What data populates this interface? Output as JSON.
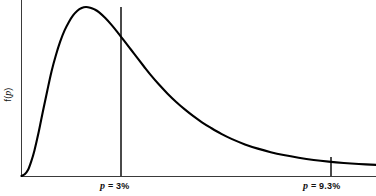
{
  "figure": {
    "background_color": "#ffffff",
    "curve_color": "#000000",
    "axis_color": "#3a3a3a",
    "marker_color": "#4a4a4a",
    "y_axis_label": "f(p)",
    "y_axis_label_variable": "p",
    "y_axis_label_prefix": "f(",
    "y_axis_label_suffix": ")"
  },
  "markers": [
    {
      "id": "mode-marker",
      "variable": "p",
      "equals": " = ",
      "value": "3%",
      "label": "p = 3%",
      "x_px": 121,
      "top_px": 7,
      "bottom_px": 176
    },
    {
      "id": "upper-marker",
      "variable": "p",
      "equals": " = ",
      "value": "9.3%",
      "label": "p = 9.3%",
      "x_px": 331,
      "top_px": 157,
      "bottom_px": 176
    }
  ],
  "chart_data": {
    "type": "line",
    "title": "",
    "subtitle": "",
    "xlabel": "",
    "ylabel": "f(p)",
    "grid": false,
    "legend": null,
    "legend_position": "none",
    "axis_style": "open-L (left spine + bottom spine only, no tick marks, no numeric tick labels)",
    "distribution_shape": "unimodal right-skewed probability density (lognormal-like)",
    "xlim": [
      0,
      16.5
    ],
    "ylim": [
      0,
      1.0
    ],
    "x_unit": "percent",
    "tick_labels": [
      "p = 3%",
      "p = 9.3%"
    ],
    "annotations": [
      {
        "text": "p = 3%",
        "x": 3,
        "y": 1.0,
        "type": "vertical-drop-line-at-mode",
        "note": "vertical line from the curve peak down to the horizontal axis"
      },
      {
        "text": "p = 9.3%",
        "x": 9.3,
        "y": 0.113,
        "type": "vertical-drop-line-on-tail",
        "note": "short vertical line from the curve down to the horizontal axis on the right tail"
      }
    ],
    "series": [
      {
        "name": "f(p)",
        "color": "#000000",
        "x": [
          0.0,
          0.15,
          0.3,
          0.45,
          0.6,
          0.8,
          1.0,
          1.2,
          1.4,
          1.6,
          1.8,
          2.0,
          2.2,
          2.4,
          2.6,
          2.8,
          3.0,
          3.2,
          3.4,
          3.6,
          3.9,
          4.2,
          4.5,
          4.8,
          5.1,
          5.4,
          5.7,
          6.0,
          6.4,
          6.8,
          7.2,
          7.6,
          8.0,
          8.4,
          8.8,
          9.3,
          9.8,
          10.4,
          11.0,
          11.6,
          12.2,
          12.9,
          13.6,
          14.3,
          15.0,
          15.7,
          16.5
        ],
        "y": [
          0.0,
          0.01,
          0.035,
          0.085,
          0.15,
          0.26,
          0.385,
          0.505,
          0.62,
          0.715,
          0.795,
          0.86,
          0.91,
          0.95,
          0.978,
          0.994,
          1.0,
          0.996,
          0.986,
          0.97,
          0.935,
          0.893,
          0.846,
          0.797,
          0.747,
          0.697,
          0.648,
          0.6,
          0.541,
          0.487,
          0.438,
          0.394,
          0.354,
          0.318,
          0.286,
          0.249,
          0.218,
          0.187,
          0.162,
          0.141,
          0.124,
          0.108,
          0.095,
          0.085,
          0.077,
          0.071,
          0.066
        ]
      }
    ],
    "key_points": [
      {
        "name": "origin",
        "x": 0,
        "y": 0
      },
      {
        "name": "mode",
        "x": 3,
        "y": 1.0
      },
      {
        "name": "upper-marker-point",
        "x": 9.3,
        "y": 0.113
      }
    ]
  }
}
